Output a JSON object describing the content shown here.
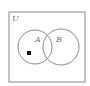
{
  "diagram": {
    "type": "venn",
    "universe_label": "U",
    "sets": [
      {
        "label": "A"
      },
      {
        "label": "B"
      }
    ],
    "marker": {
      "shape": "filled-square",
      "region": "A only"
    },
    "colors": {
      "stroke": "#8a8a8a",
      "marker": "#111111",
      "background": "#ffffff"
    }
  }
}
